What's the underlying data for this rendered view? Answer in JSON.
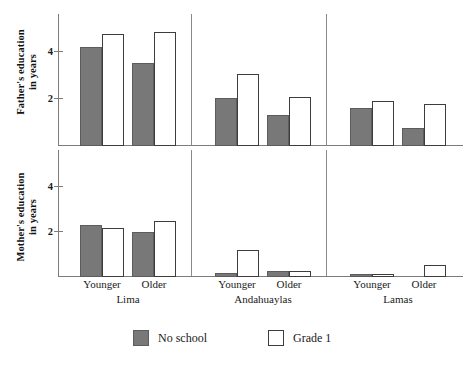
{
  "chart_data": {
    "type": "bar",
    "title": "",
    "subtitle": "",
    "grid": false,
    "legend_position": "bottom",
    "panels": [
      {
        "id": "father",
        "ylabel": "Father's education\nin years",
        "ylabel_line1": "Father's education",
        "ylabel_line2": "in years",
        "ylim": [
          0,
          5.6
        ],
        "yticks": [
          2,
          4
        ],
        "yticklabels": [
          "2",
          "4"
        ],
        "categories": [
          "Lima / Younger",
          "Lima / Older",
          "Andahuaylas / Younger",
          "Andahuaylas / Older",
          "Lamas / Younger",
          "Lamas / Older"
        ],
        "series": [
          {
            "name": "No school",
            "values": [
              4.2,
              3.55,
              2.05,
              1.3,
              1.6,
              0.75
            ]
          },
          {
            "name": "Grade 1",
            "values": [
              4.75,
              4.85,
              3.05,
              2.1,
              1.9,
              1.8
            ]
          }
        ]
      },
      {
        "id": "mother",
        "ylabel": "Mother's education\nin years",
        "ylabel_line1": "Mother's education",
        "ylabel_line2": "in years",
        "ylim": [
          0,
          5.6
        ],
        "yticks": [
          2,
          4
        ],
        "yticklabels": [
          "2",
          "4"
        ],
        "categories": [
          "Lima / Younger",
          "Lima / Older",
          "Andahuaylas / Younger",
          "Andahuaylas / Older",
          "Lamas / Younger",
          "Lamas / Older"
        ],
        "series": [
          {
            "name": "No school",
            "values": [
              2.3,
              2.0,
              0.2,
              0.25,
              0.15,
              0.0
            ]
          },
          {
            "name": "Grade 1",
            "values": [
              2.2,
              2.5,
              1.2,
              0.25,
              0.15,
              0.55
            ]
          }
        ]
      }
    ],
    "xlabel": "",
    "groups": [
      {
        "name": "Lima",
        "subcategories": [
          "Younger",
          "Older"
        ]
      },
      {
        "name": "Andahuaylas",
        "subcategories": [
          "Younger",
          "Older"
        ]
      },
      {
        "name": "Lamas",
        "subcategories": [
          "Younger",
          "Older"
        ]
      }
    ],
    "legend": [
      {
        "label": "No school",
        "color": "#787878",
        "style": "filled"
      },
      {
        "label": "Grade 1",
        "color": "#ffffff",
        "style": "outlined"
      }
    ],
    "colors": {
      "no_school_fill": "#787878",
      "no_school_border": "#5c5c5c",
      "grade1_fill": "#ffffff",
      "grade1_border": "#3d3d3d",
      "axis": "#7c7c7c",
      "text": "#1a1a1a"
    }
  },
  "axes": {
    "father": {
      "title_line1": "Father's education",
      "title_line2": "in years",
      "tick_2": "2",
      "tick_4": "4"
    },
    "mother": {
      "title_line1": "Mother's education",
      "title_line2": "in years",
      "tick_2": "2",
      "tick_4": "4"
    }
  },
  "xaxis": {
    "cats": [
      {
        "label": "Younger"
      },
      {
        "label": "Older"
      },
      {
        "label": "Younger"
      },
      {
        "label": "Older"
      },
      {
        "label": "Younger"
      },
      {
        "label": "Older"
      }
    ],
    "groups": [
      {
        "label": "Lima"
      },
      {
        "label": "Andahuaylas"
      },
      {
        "label": "Lamas"
      }
    ]
  },
  "legend": {
    "no_school": "No school",
    "grade1": "Grade 1"
  },
  "caption": {
    "text": ""
  }
}
